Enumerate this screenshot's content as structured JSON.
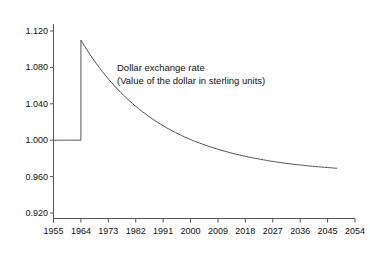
{
  "chart_data": {
    "type": "line",
    "title": "",
    "subtitle": "",
    "xlabel": "",
    "ylabel": "",
    "xlim": [
      1955,
      2054
    ],
    "ylim": [
      0.92,
      1.12
    ],
    "grid": false,
    "legend": "none",
    "annotations": [
      "Dollar exchange rate",
      "(Value of the dollar in sterling units)"
    ],
    "annotation_line1": "Dollar exchange rate",
    "annotation_line2": "(Value of the dollar in sterling units)",
    "x_ticks": [
      1955,
      1964,
      1973,
      1982,
      1991,
      2000,
      2009,
      2018,
      2027,
      2036,
      2045,
      2054
    ],
    "x_tick_labels": [
      "1955",
      "1964",
      "1973",
      "1982",
      "1991",
      "2000",
      "2009",
      "2018",
      "2027",
      "2036",
      "2045",
      "2054"
    ],
    "y_ticks": [
      0.92,
      0.96,
      1.0,
      1.04,
      1.08,
      1.12
    ],
    "y_tick_labels": [
      "0.920",
      "0.960",
      "1.000",
      "1.040",
      "1.080",
      "1.120"
    ],
    "series": [
      {
        "name": "Dollar exchange rate",
        "color": "#555555",
        "x": [
          1955,
          1956,
          1957,
          1958,
          1959,
          1960,
          1961,
          1962,
          1963,
          1964,
          1964,
          1965,
          1966,
          1967,
          1968,
          1969,
          1970,
          1971,
          1972,
          1973,
          1974,
          1975,
          1976,
          1977,
          1978,
          1979,
          1980,
          1981,
          1982,
          1983,
          1984,
          1985,
          1986,
          1987,
          1988,
          1989,
          1990,
          1991,
          1992,
          1993,
          1994,
          1995,
          1996,
          1997,
          1998,
          1999,
          2000,
          2001,
          2002,
          2003,
          2004,
          2005,
          2006,
          2007,
          2008,
          2009,
          2010,
          2011,
          2012,
          2013,
          2014,
          2015,
          2016,
          2017,
          2018,
          2019,
          2020,
          2021,
          2022,
          2023,
          2024,
          2025,
          2026,
          2027,
          2028,
          2029,
          2030,
          2031,
          2032,
          2033,
          2034,
          2035,
          2036,
          2037,
          2038,
          2039,
          2040,
          2041,
          2042,
          2043,
          2044,
          2045,
          2046,
          2047,
          2048
        ],
        "y": [
          1.0,
          1.0,
          1.0,
          1.0,
          1.0,
          1.0,
          1.0,
          1.0,
          1.0,
          1.0,
          1.11,
          1.1045,
          1.0992,
          1.0941,
          1.0892,
          1.0845,
          1.08,
          1.0756,
          1.0714,
          1.0674,
          1.0635,
          1.0598,
          1.0562,
          1.0527,
          1.0494,
          1.0462,
          1.0431,
          1.0401,
          1.0372,
          1.0345,
          1.0318,
          1.0293,
          1.0268,
          1.0245,
          1.0222,
          1.02,
          1.0179,
          1.0159,
          1.0139,
          1.0121,
          1.0103,
          1.0085,
          1.0069,
          1.0053,
          1.0037,
          1.0022,
          1.0008,
          0.9994,
          0.9981,
          0.9968,
          0.9956,
          0.9944,
          0.9932,
          0.9921,
          0.9911,
          0.99,
          0.989,
          0.9881,
          0.9872,
          0.9863,
          0.9854,
          0.9846,
          0.9838,
          0.983,
          0.9823,
          0.9816,
          0.9809,
          0.9802,
          0.9796,
          0.979,
          0.9784,
          0.9778,
          0.9772,
          0.9767,
          0.9762,
          0.9757,
          0.9752,
          0.9748,
          0.9743,
          0.9739,
          0.9735,
          0.9731,
          0.9727,
          0.9724,
          0.972,
          0.9717,
          0.9714,
          0.9711,
          0.9708,
          0.9705,
          0.9702,
          0.9699,
          0.9697,
          0.9694,
          0.9692
        ]
      }
    ],
    "notable_points": {
      "pre_jump_level": 1.0,
      "jump_year": 1964,
      "peak_value": 1.11,
      "final_year": 2048,
      "final_value": 0.926
    }
  },
  "axes": {
    "axis_color": "#555555",
    "line_color": "#555555"
  }
}
